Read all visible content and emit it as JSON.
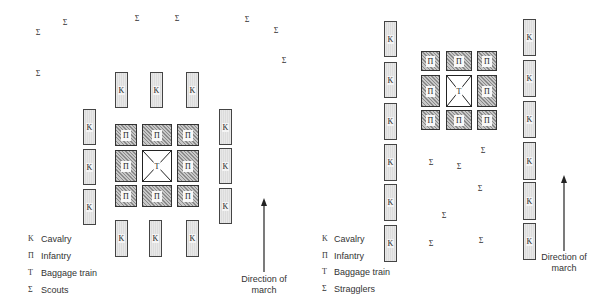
{
  "symbols": {
    "cavalry": "K",
    "infantry": "Π",
    "baggage": "T",
    "sigma": "Σ"
  },
  "left_diagram": {
    "legend": [
      {
        "symbol": "K",
        "label": "Cavalry"
      },
      {
        "symbol": "Π",
        "label": "Infantry"
      },
      {
        "symbol": "T",
        "label": "Baggage train"
      },
      {
        "symbol": "Σ",
        "label": "Scouts"
      }
    ],
    "direction_label_line1": "Direction of",
    "direction_label_line2": "march"
  },
  "right_diagram": {
    "legend": [
      {
        "symbol": "K",
        "label": "Cavalry"
      },
      {
        "symbol": "Π",
        "label": "Infantry"
      },
      {
        "symbol": "T",
        "label": "Baggage train"
      },
      {
        "symbol": "Σ",
        "label": "Stragglers"
      }
    ],
    "direction_label_line1": "Direction of",
    "direction_label_line2": "march"
  }
}
